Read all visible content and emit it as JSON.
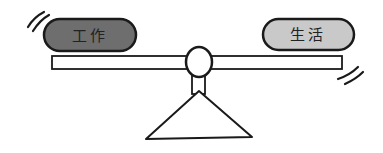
{
  "diagram": {
    "left_block": {
      "label": "工作",
      "fill": "#6e6e6e"
    },
    "right_block": {
      "label": "生活",
      "fill": "#c9c9c9"
    },
    "stroke_color": "#1a1a1a",
    "background": "#ffffff"
  }
}
